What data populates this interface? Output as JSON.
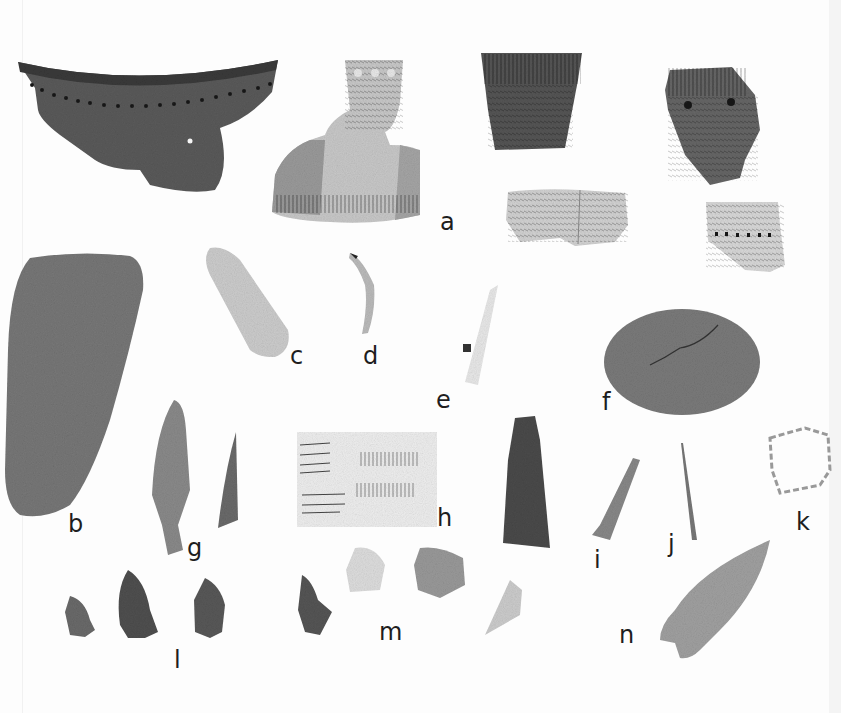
{
  "plate": {
    "description": "Photographic plate of archaeological artifacts: pottery sherds, stone tools, bone/metal implements and projectile points",
    "background": "#fdfdfd"
  },
  "labels": [
    {
      "id": "a",
      "text": "a",
      "x": 440,
      "y": 212
    },
    {
      "id": "b",
      "text": "b",
      "x": 68,
      "y": 514
    },
    {
      "id": "c",
      "text": "c",
      "x": 290,
      "y": 346
    },
    {
      "id": "d",
      "text": "d",
      "x": 363,
      "y": 346
    },
    {
      "id": "e",
      "text": "e",
      "x": 436,
      "y": 390
    },
    {
      "id": "f",
      "text": "f",
      "x": 602,
      "y": 392
    },
    {
      "id": "g",
      "text": "g",
      "x": 187,
      "y": 540
    },
    {
      "id": "h",
      "text": "h",
      "x": 437,
      "y": 508
    },
    {
      "id": "i",
      "text": "i",
      "x": 594,
      "y": 550
    },
    {
      "id": "j",
      "text": "j",
      "x": 668,
      "y": 534
    },
    {
      "id": "k",
      "text": "k",
      "x": 796,
      "y": 512
    },
    {
      "id": "l",
      "text": "l",
      "x": 174,
      "y": 650
    },
    {
      "id": "m",
      "text": "m",
      "x": 379,
      "y": 622
    },
    {
      "id": "n",
      "text": "n",
      "x": 619,
      "y": 625
    }
  ],
  "artifacts": [
    {
      "id": "a",
      "name": "decorated pottery rim sherds (6 pieces)"
    },
    {
      "id": "b",
      "name": "ground stone adze/celt"
    },
    {
      "id": "c",
      "name": "flake blade"
    },
    {
      "id": "d",
      "name": "curved bone fragment"
    },
    {
      "id": "e",
      "name": "bone tube/awl with perforation"
    },
    {
      "id": "f",
      "name": "hammerstone cobble"
    },
    {
      "id": "g",
      "name": "stemmed points (2)"
    },
    {
      "id": "h",
      "name": "incised bone/shell plaque"
    },
    {
      "id": "i",
      "name": "metal/bone tool"
    },
    {
      "id": "j",
      "name": "needle/awl"
    },
    {
      "id": "k",
      "name": "bead string"
    },
    {
      "id": "l",
      "name": "notched projectile points (3)"
    },
    {
      "id": "m",
      "name": "scrapers/flakes (4)"
    },
    {
      "id": "n",
      "name": "large side-notched point"
    }
  ]
}
